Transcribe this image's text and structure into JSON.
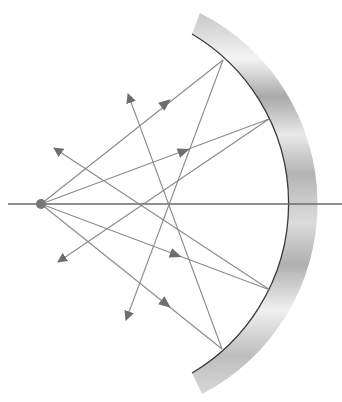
{
  "diagram": {
    "type": "concave-mirror-ray-diagram",
    "colors": {
      "background": "#ffffff",
      "ray": "#8a8a8a",
      "arrow": "#6e6e6e",
      "axis": "#6a6a6a",
      "mirror_edge": "#3a3a3a",
      "mirror_light": "#f2f2f2",
      "mirror_dark": "#a8a8a8",
      "source": "#777777"
    },
    "principal_axis": {
      "x1": 8,
      "y1": 204,
      "x2": 342,
      "y2": 204
    },
    "source": {
      "x": 41,
      "y": 204,
      "r": 5
    },
    "mirror": {
      "inner": {
        "top": [
          192,
          34
        ],
        "vertex": [
          290,
          204
        ],
        "bottom": [
          192,
          373
        ],
        "radius": 197
      },
      "outer": {
        "top": [
          200,
          13
        ],
        "vertex": [
          313,
          204
        ],
        "bottom": [
          202,
          394
        ],
        "radius": 214
      }
    },
    "rays": [
      {
        "incident": [
          [
            41,
            204
          ],
          [
            223,
            60
          ]
        ],
        "reflected": [
          [
            223,
            60
          ],
          [
            126,
            320
          ]
        ],
        "incident_arrow": [
          165,
          104
        ],
        "reflected_arrow_tip": [
          126,
          320
        ]
      },
      {
        "incident": [
          [
            41,
            204
          ],
          [
            269,
            119
          ]
        ],
        "reflected": [
          [
            269,
            119
          ],
          [
            58,
            262
          ]
        ],
        "incident_arrow": [
          183,
          153
        ],
        "reflected_arrow_tip": [
          58,
          262
        ]
      },
      {
        "incident": [
          [
            41,
            204
          ],
          [
            270,
            290
          ]
        ],
        "reflected": [
          [
            270,
            290
          ],
          [
            54,
            148
          ]
        ],
        "incident_arrow": [
          175,
          256
        ],
        "reflected_arrow_tip": [
          54,
          148
        ]
      },
      {
        "incident": [
          [
            41,
            204
          ],
          [
            222,
            349
          ]
        ],
        "reflected": [
          [
            222,
            349
          ],
          [
            128,
            94
          ]
        ],
        "incident_arrow": [
          166,
          304
        ],
        "reflected_arrow_tip": [
          128,
          94
        ]
      }
    ]
  }
}
